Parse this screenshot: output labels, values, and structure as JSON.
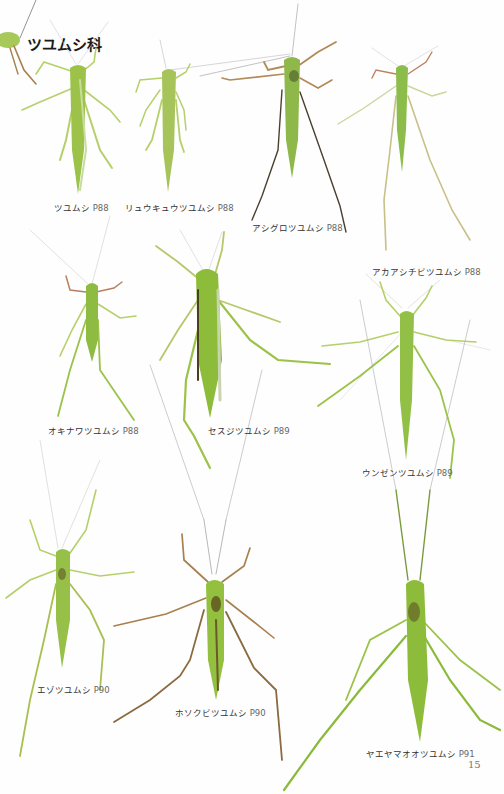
{
  "page": {
    "section_title": "ツユムシ科",
    "page_number": "15",
    "background": "#ffffff"
  },
  "species": [
    {
      "name": "ツユムシ",
      "page_ref": "P88"
    },
    {
      "name": "リュウキュウツユムシ",
      "page_ref": "P88"
    },
    {
      "name": "アシグロツユムシ",
      "page_ref": "P88"
    },
    {
      "name": "アカアシチビツユムシ",
      "page_ref": "P88"
    },
    {
      "name": "オキナワツユムシ",
      "page_ref": "P88"
    },
    {
      "name": "セスジツユムシ",
      "page_ref": "P89"
    },
    {
      "name": "ウンゼンツユムシ",
      "page_ref": "P89"
    },
    {
      "name": "エゾツユムシ",
      "page_ref": "P90"
    },
    {
      "name": "ホソクビツユムシ",
      "page_ref": "P90"
    },
    {
      "name": "ヤエヤマオオツユムシ",
      "page_ref": "P91"
    }
  ],
  "colors": {
    "body_green": "#9cc24a",
    "body_dark": "#7aa83a",
    "leg_green": "#b5d06a",
    "leg_brown": "#a8804e",
    "leg_dark": "#4a4030",
    "text": "#333333"
  }
}
